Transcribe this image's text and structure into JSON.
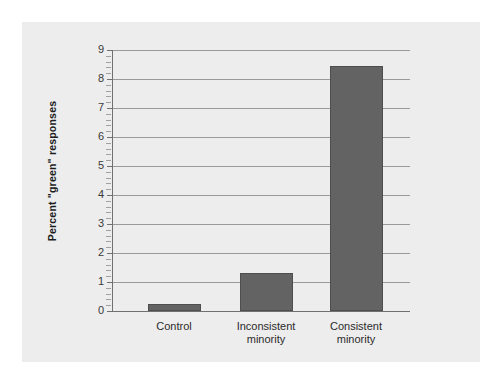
{
  "figure": {
    "caption_remnant": "",
    "panel_color": "#ededed",
    "page_color": "#ffffff"
  },
  "chart_data": {
    "type": "bar",
    "title": "",
    "subtitle": "",
    "xlabel": "",
    "ylabel": "Percent \"green\" responses",
    "categories": [
      "Control",
      "Inconsistent minority",
      "Consistent minority"
    ],
    "category_lines": [
      [
        "Control",
        ""
      ],
      [
        "Inconsistent",
        "minority"
      ],
      [
        "Consistent",
        "minority"
      ]
    ],
    "values": [
      0.25,
      1.3,
      8.45
    ],
    "ylim": [
      0,
      9
    ],
    "ytick_labels": [
      "0",
      "1",
      "2",
      "3",
      "4",
      "5",
      "6",
      "7",
      "8",
      "9"
    ],
    "ytick_values": [
      0,
      1,
      2,
      3,
      4,
      5,
      6,
      7,
      8,
      9
    ],
    "minor_ticks_per_interval": 4,
    "grid": "horizontal-major",
    "legend": "none",
    "bar_color": "#636363",
    "bar_edge_color": "#4e4e4e",
    "gridline_color": "#9a9a9a",
    "axis_color": "#707070"
  }
}
